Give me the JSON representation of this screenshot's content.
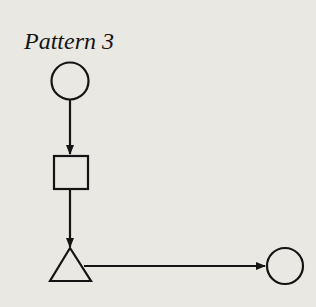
{
  "title": "Pattern 3",
  "nodes": [
    {
      "id": "start-circle",
      "shape": "circle"
    },
    {
      "id": "process-square",
      "shape": "square"
    },
    {
      "id": "decision-triangle",
      "shape": "triangle"
    },
    {
      "id": "end-circle",
      "shape": "circle"
    }
  ],
  "edges": [
    {
      "from": "start-circle",
      "to": "process-square"
    },
    {
      "from": "process-square",
      "to": "decision-triangle"
    },
    {
      "from": "decision-triangle",
      "to": "end-circle"
    }
  ],
  "colors": {
    "stroke": "#141414",
    "background": "#e9e8e3"
  }
}
